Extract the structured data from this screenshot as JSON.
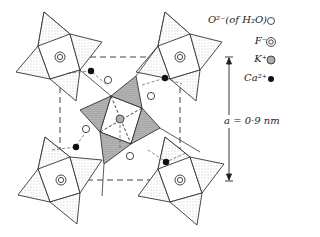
{
  "diagram": {
    "type": "crystal-structure-projection",
    "unit_cell": {
      "shape": "dashed-square",
      "corners_label": "K+ / F- sites"
    },
    "scale": {
      "label": "a = 0·9 nm"
    },
    "colors": {
      "line": "#333333",
      "stipple_light": "#e6e6e6",
      "stipple_dark": "#9a9a9a",
      "ca": "#111111"
    }
  },
  "legend": {
    "items": [
      {
        "label": "O²⁻(of H₂O)",
        "symbol": "open-circle"
      },
      {
        "label": "F⁻",
        "symbol": "double-ring"
      },
      {
        "label": "K⁺",
        "symbol": "dotted-circle"
      },
      {
        "label": "Ca²⁺",
        "symbol": "filled-circle"
      }
    ]
  }
}
